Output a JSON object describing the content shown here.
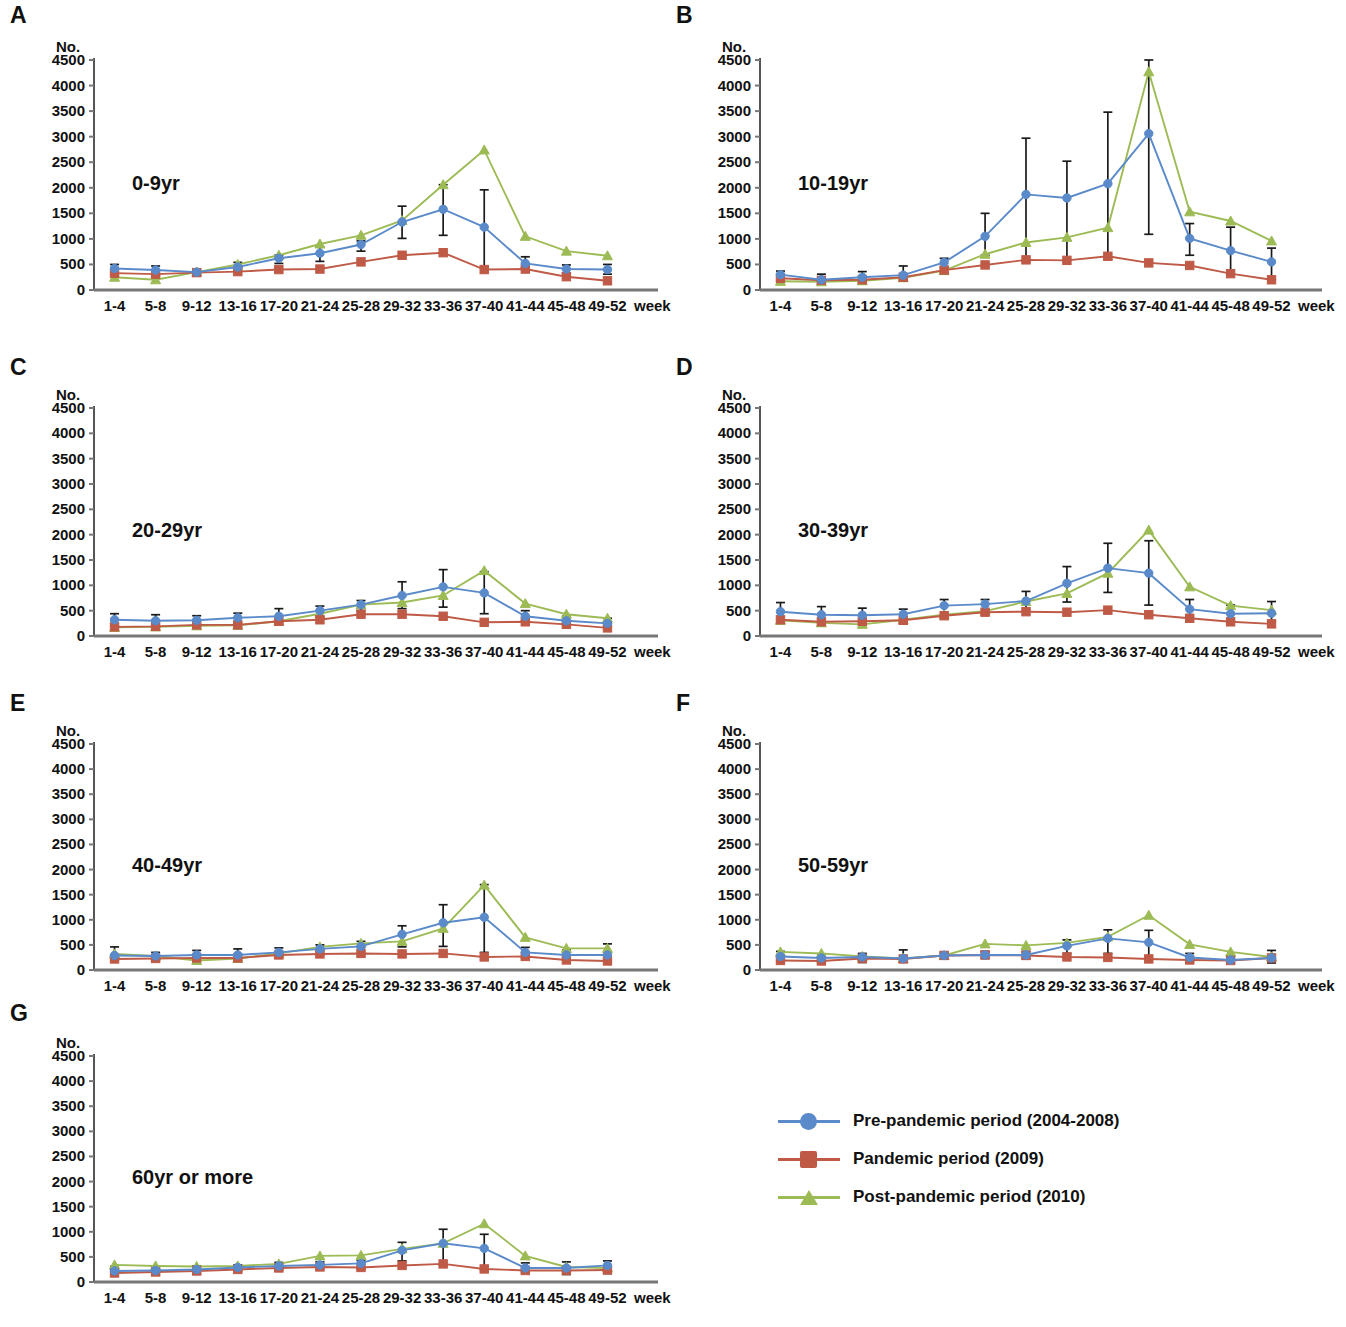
{
  "figure": {
    "y_axis_unit": "No.",
    "x_axis_unit": "week",
    "y_ticks": [
      "4500",
      "4000",
      "3500",
      "3000",
      "2500",
      "2000",
      "1500",
      "1000",
      "500",
      "0"
    ],
    "x_ticks": [
      "1-4",
      "5-8",
      "9-12",
      "13-16",
      "17-20",
      "21-24",
      "25-28",
      "29-32",
      "33-36",
      "37-40",
      "41-44",
      "45-48",
      "49-52"
    ]
  },
  "colors": {
    "pre_pandemic": "#5a8ac9",
    "pandemic": "#bf5a47",
    "post_pandemic": "#9dbb55",
    "error_bar": "#1a1a1a",
    "axis": "#6b6b6b"
  },
  "legend": {
    "items": [
      {
        "label": "Pre-pandemic period (2004-2008)",
        "color_key": "pre_pandemic",
        "marker": "circle"
      },
      {
        "label": "Pandemic period (2009)",
        "color_key": "pandemic",
        "marker": "square"
      },
      {
        "label": "Post-pandemic period (2010)",
        "color_key": "post_pandemic",
        "marker": "tri"
      }
    ]
  },
  "panels": [
    {
      "letter": "A",
      "age_label": "0-9yr"
    },
    {
      "letter": "B",
      "age_label": "10-19yr"
    },
    {
      "letter": "C",
      "age_label": "20-29yr"
    },
    {
      "letter": "D",
      "age_label": "30-39yr"
    },
    {
      "letter": "E",
      "age_label": "40-49yr"
    },
    {
      "letter": "F",
      "age_label": "50-59yr"
    },
    {
      "letter": "G",
      "age_label": "60yr or more"
    }
  ],
  "chart_data": [
    {
      "type": "line",
      "panel": "A",
      "title": "0-9yr",
      "xlabel": "week",
      "ylabel": "No.",
      "ylim": [
        0,
        4500
      ],
      "grid": false,
      "legend_position": "external-bottom-right",
      "categories": [
        "1-4",
        "5-8",
        "9-12",
        "13-16",
        "17-20",
        "21-24",
        "25-28",
        "29-32",
        "33-36",
        "37-40",
        "41-44",
        "45-48",
        "49-52"
      ],
      "series": [
        {
          "name": "Pre-pandemic period (2004-2008)",
          "values": [
            420,
            390,
            350,
            450,
            620,
            720,
            890,
            1330,
            1580,
            1230,
            520,
            410,
            400
          ],
          "err_low": [
            280,
            280,
            300,
            380,
            520,
            560,
            760,
            1010,
            1070,
            430,
            440,
            330,
            310
          ],
          "err_high": [
            500,
            470,
            400,
            540,
            680,
            840,
            960,
            1640,
            2060,
            1960,
            650,
            490,
            500
          ]
        },
        {
          "name": "Pandemic period (2009)",
          "values": [
            330,
            310,
            340,
            360,
            400,
            410,
            550,
            680,
            730,
            400,
            410,
            260,
            180
          ],
          "err_low": [
            null,
            null,
            null,
            null,
            null,
            null,
            null,
            null,
            null,
            null,
            null,
            null,
            null
          ],
          "err_high": [
            null,
            null,
            null,
            null,
            null,
            null,
            null,
            null,
            null,
            null,
            null,
            null,
            null
          ]
        },
        {
          "name": "Post-pandemic period (2010)",
          "values": [
            250,
            200,
            350,
            500,
            680,
            900,
            1070,
            1360,
            2060,
            2740,
            1050,
            760,
            670
          ],
          "err_low": [
            null,
            null,
            null,
            null,
            null,
            null,
            null,
            null,
            null,
            null,
            null,
            null,
            null
          ],
          "err_high": [
            null,
            null,
            null,
            null,
            null,
            null,
            null,
            null,
            null,
            null,
            null,
            null,
            null
          ]
        }
      ]
    },
    {
      "type": "line",
      "panel": "B",
      "title": "10-19yr",
      "xlabel": "week",
      "ylabel": "No.",
      "ylim": [
        0,
        4500
      ],
      "grid": false,
      "categories": [
        "1-4",
        "5-8",
        "9-12",
        "13-16",
        "17-20",
        "21-24",
        "25-28",
        "29-32",
        "33-36",
        "37-40",
        "41-44",
        "45-48",
        "49-52"
      ],
      "series": [
        {
          "name": "Pre-pandemic period (2004-2008)",
          "values": [
            300,
            200,
            250,
            290,
            540,
            1050,
            1870,
            1800,
            2080,
            3060,
            1010,
            770,
            550
          ],
          "err_low": [
            180,
            130,
            150,
            220,
            440,
            680,
            560,
            590,
            600,
            1090,
            680,
            310,
            200
          ],
          "err_high": [
            370,
            310,
            360,
            470,
            620,
            1500,
            2970,
            2520,
            3480,
            4800,
            1300,
            1230,
            820
          ]
        },
        {
          "name": "Pandemic period (2009)",
          "values": [
            230,
            190,
            200,
            250,
            390,
            490,
            590,
            580,
            660,
            530,
            480,
            320,
            200
          ],
          "err_low": [
            null,
            null,
            null,
            null,
            null,
            null,
            null,
            null,
            null,
            null,
            null,
            null,
            null
          ],
          "err_high": [
            null,
            null,
            null,
            null,
            null,
            null,
            null,
            null,
            null,
            null,
            null,
            null,
            null
          ]
        },
        {
          "name": "Post-pandemic period (2010)",
          "values": [
            170,
            160,
            180,
            240,
            380,
            700,
            930,
            1030,
            1220,
            4270,
            1530,
            1350,
            960
          ],
          "err_low": [
            null,
            null,
            null,
            null,
            null,
            null,
            null,
            null,
            null,
            null,
            null,
            null,
            null
          ],
          "err_high": [
            null,
            null,
            null,
            null,
            null,
            null,
            null,
            null,
            null,
            null,
            null,
            null,
            null
          ]
        }
      ]
    },
    {
      "type": "line",
      "panel": "C",
      "title": "20-29yr",
      "xlabel": "week",
      "ylabel": "No.",
      "ylim": [
        0,
        4500
      ],
      "grid": false,
      "categories": [
        "1-4",
        "5-8",
        "9-12",
        "13-16",
        "17-20",
        "21-24",
        "25-28",
        "29-32",
        "33-36",
        "37-40",
        "41-44",
        "45-48",
        "49-52"
      ],
      "series": [
        {
          "name": "Pre-pandemic period (2004-2008)",
          "values": [
            320,
            300,
            310,
            360,
            390,
            500,
            620,
            800,
            970,
            850,
            390,
            300,
            250
          ],
          "err_low": [
            200,
            200,
            200,
            250,
            270,
            380,
            500,
            540,
            570,
            440,
            300,
            220,
            170
          ],
          "err_high": [
            440,
            420,
            400,
            450,
            540,
            590,
            700,
            1070,
            1310,
            1270,
            500,
            390,
            350
          ]
        },
        {
          "name": "Pandemic period (2009)",
          "values": [
            180,
            190,
            220,
            220,
            290,
            320,
            430,
            430,
            390,
            270,
            280,
            230,
            160
          ],
          "err_low": [
            null,
            null,
            null,
            null,
            null,
            null,
            null,
            null,
            null,
            null,
            null,
            null,
            null
          ],
          "err_high": [
            null,
            null,
            null,
            null,
            null,
            null,
            null,
            null,
            null,
            null,
            null,
            null,
            null
          ]
        },
        {
          "name": "Post-pandemic period (2010)",
          "values": [
            170,
            180,
            200,
            210,
            290,
            440,
            620,
            660,
            800,
            1290,
            640,
            430,
            350
          ]
        }
      ]
    },
    {
      "type": "line",
      "panel": "D",
      "title": "30-39yr",
      "xlabel": "week",
      "ylabel": "No.",
      "ylim": [
        0,
        4500
      ],
      "grid": false,
      "categories": [
        "1-4",
        "5-8",
        "9-12",
        "13-16",
        "17-20",
        "21-24",
        "25-28",
        "29-32",
        "33-36",
        "37-40",
        "41-44",
        "45-48",
        "49-52"
      ],
      "series": [
        {
          "name": "Pre-pandemic period (2004-2008)",
          "values": [
            480,
            420,
            410,
            430,
            600,
            630,
            690,
            1040,
            1340,
            1240,
            530,
            440,
            450
          ],
          "err_low": [
            300,
            270,
            260,
            290,
            390,
            460,
            480,
            670,
            860,
            610,
            360,
            290,
            290
          ],
          "err_high": [
            660,
            580,
            550,
            530,
            720,
            720,
            880,
            1370,
            1830,
            1880,
            720,
            610,
            680
          ]
        },
        {
          "name": "Pandemic period (2009)",
          "values": [
            320,
            280,
            290,
            310,
            400,
            470,
            480,
            470,
            510,
            420,
            350,
            280,
            240
          ]
        },
        {
          "name": "Post-pandemic period (2010)",
          "values": [
            310,
            260,
            230,
            320,
            420,
            490,
            680,
            840,
            1240,
            2090,
            970,
            600,
            510
          ]
        }
      ]
    },
    {
      "type": "line",
      "panel": "E",
      "title": "40-49yr",
      "xlabel": "week",
      "ylabel": "No.",
      "ylim": [
        0,
        4500
      ],
      "grid": false,
      "categories": [
        "1-4",
        "5-8",
        "9-12",
        "13-16",
        "17-20",
        "21-24",
        "25-28",
        "29-32",
        "33-36",
        "37-40",
        "41-44",
        "45-48",
        "49-52"
      ],
      "series": [
        {
          "name": "Pre-pandemic period (2004-2008)",
          "values": [
            290,
            280,
            300,
            300,
            350,
            420,
            470,
            710,
            940,
            1050,
            350,
            300,
            300
          ],
          "err_low": [
            190,
            200,
            200,
            190,
            250,
            300,
            330,
            460,
            470,
            350,
            230,
            200,
            180
          ],
          "err_high": [
            460,
            350,
            390,
            420,
            440,
            500,
            570,
            880,
            1300,
            1700,
            450,
            400,
            520
          ]
        },
        {
          "name": "Pandemic period (2009)",
          "values": [
            220,
            230,
            240,
            240,
            300,
            320,
            330,
            320,
            330,
            260,
            270,
            200,
            180
          ]
        },
        {
          "name": "Post-pandemic period (2010)",
          "values": [
            320,
            280,
            190,
            230,
            330,
            460,
            530,
            570,
            830,
            1690,
            650,
            430,
            430
          ]
        }
      ]
    },
    {
      "type": "line",
      "panel": "F",
      "title": "50-59yr",
      "xlabel": "week",
      "ylabel": "No.",
      "ylim": [
        0,
        4500
      ],
      "grid": false,
      "categories": [
        "1-4",
        "5-8",
        "9-12",
        "13-16",
        "17-20",
        "21-24",
        "25-28",
        "29-32",
        "33-36",
        "37-40",
        "41-44",
        "45-48",
        "49-52"
      ],
      "series": [
        {
          "name": "Pre-pandemic period (2004-2008)",
          "values": [
            270,
            240,
            260,
            230,
            290,
            300,
            300,
            480,
            630,
            550,
            250,
            200,
            240
          ],
          "err_low": [
            180,
            160,
            150,
            160,
            220,
            230,
            230,
            330,
            330,
            210,
            170,
            140,
            140
          ],
          "err_high": [
            370,
            320,
            330,
            400,
            350,
            370,
            370,
            600,
            800,
            790,
            330,
            280,
            390
          ]
        },
        {
          "name": "Pandemic period (2009)",
          "values": [
            190,
            180,
            230,
            220,
            290,
            300,
            290,
            260,
            250,
            220,
            200,
            190,
            240
          ]
        },
        {
          "name": "Post-pandemic period (2010)",
          "values": [
            360,
            330,
            270,
            230,
            290,
            520,
            490,
            540,
            660,
            1090,
            510,
            360,
            260
          ]
        }
      ]
    },
    {
      "type": "line",
      "panel": "G",
      "title": "60yr or more",
      "xlabel": "week",
      "ylabel": "No.",
      "ylim": [
        0,
        4500
      ],
      "grid": false,
      "categories": [
        "1-4",
        "5-8",
        "9-12",
        "13-16",
        "17-20",
        "21-24",
        "25-28",
        "29-32",
        "33-36",
        "37-40",
        "41-44",
        "45-48",
        "49-52"
      ],
      "series": [
        {
          "name": "Pre-pandemic period (2004-2008)",
          "values": [
            220,
            230,
            250,
            290,
            320,
            340,
            370,
            630,
            770,
            670,
            280,
            280,
            330
          ],
          "err_low": [
            170,
            160,
            170,
            210,
            240,
            250,
            260,
            420,
            340,
            240,
            200,
            150,
            170
          ],
          "err_high": [
            310,
            310,
            320,
            340,
            390,
            400,
            430,
            790,
            1050,
            950,
            380,
            400,
            420
          ]
        },
        {
          "name": "Pandemic period (2009)",
          "values": [
            180,
            200,
            220,
            250,
            280,
            300,
            290,
            330,
            360,
            260,
            230,
            230,
            240
          ]
        },
        {
          "name": "Post-pandemic period (2010)",
          "values": [
            340,
            320,
            310,
            320,
            360,
            520,
            530,
            660,
            770,
            1160,
            520,
            300,
            280
          ]
        }
      ]
    }
  ]
}
